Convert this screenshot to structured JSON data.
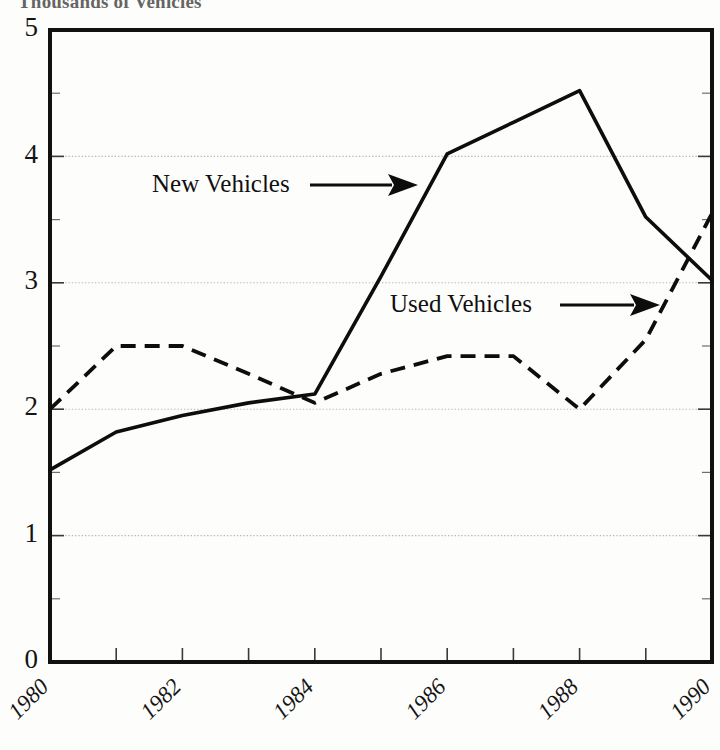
{
  "figure": {
    "title": "Thousands of Vehicles",
    "title_truncated": true,
    "background_color": "#fdfdfb",
    "ink_color": "#0d0d0d"
  },
  "chart_data": {
    "type": "line",
    "title": "Thousands of Vehicles",
    "xlabel": "",
    "ylabel": "Thousands of Vehicles",
    "x": [
      1980,
      1981,
      1982,
      1983,
      1984,
      1985,
      1986,
      1987,
      1988,
      1989,
      1990
    ],
    "xlim": [
      1980,
      1990
    ],
    "ylim": [
      0,
      5
    ],
    "grid": true,
    "legend_position": "inline-annotations",
    "y_ticks": [
      0,
      1,
      2,
      3,
      4,
      5
    ],
    "y_tick_labels": [
      "0",
      "1",
      "2",
      "3",
      "4",
      "5"
    ],
    "y_minor_ticks": [
      0.5,
      1.5,
      2.5,
      3.5,
      4.5
    ],
    "x_ticks": [
      1980,
      1981,
      1982,
      1983,
      1984,
      1985,
      1986,
      1987,
      1988,
      1989,
      1990
    ],
    "x_tick_labels": [
      "1980",
      "1982",
      "1984",
      "1986",
      "1988",
      "1990"
    ],
    "x_labeled_values": [
      1980,
      1982,
      1984,
      1986,
      1988,
      1990
    ],
    "x_tick_label_rotation": -45,
    "series": [
      {
        "name": "New Vehicles",
        "style": "solid",
        "values": [
          1.52,
          1.82,
          1.95,
          2.05,
          2.12,
          3.05,
          4.02,
          4.27,
          4.52,
          3.52,
          3.02
        ]
      },
      {
        "name": "Used Vehicles",
        "style": "dashed",
        "values": [
          2.0,
          2.5,
          2.5,
          2.28,
          2.05,
          2.28,
          2.42,
          2.42,
          2.0,
          2.55,
          3.55
        ]
      }
    ],
    "annotations": [
      {
        "text": "New Vehicles",
        "points_to_series": "New Vehicles",
        "arrow_direction": "right"
      },
      {
        "text": "Used Vehicles",
        "points_to_series": "Used Vehicles",
        "arrow_direction": "right"
      }
    ]
  }
}
